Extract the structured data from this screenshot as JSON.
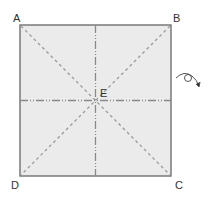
{
  "diagram": {
    "type": "origami-crease-pattern",
    "square": {
      "x": 20,
      "y": 25,
      "size": 151,
      "fill": "#ebebeb",
      "stroke": "#7a7a7a"
    },
    "crease_color": "#999999",
    "points": {
      "A": {
        "label": "A",
        "x": 13,
        "y": 13
      },
      "B": {
        "label": "B",
        "x": 173,
        "y": 13
      },
      "C": {
        "label": "C",
        "x": 175,
        "y": 180
      },
      "D": {
        "label": "D",
        "x": 11,
        "y": 180
      },
      "E": {
        "label": "E",
        "x": 100,
        "y": 88
      }
    },
    "creases": [
      {
        "name": "diagonal-AC",
        "kind": "valley"
      },
      {
        "name": "diagonal-BD",
        "kind": "valley"
      },
      {
        "name": "vertical-center",
        "kind": "mountain"
      },
      {
        "name": "horizontal-center",
        "kind": "mountain"
      }
    ],
    "turn_over_icon": "turn-over-arrow"
  }
}
